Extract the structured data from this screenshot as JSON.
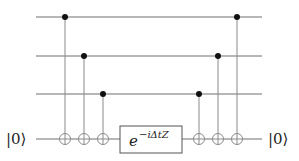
{
  "diagram": {
    "type": "quantum-circuit",
    "num_wires": 4,
    "input_label": "|0⟩",
    "output_label": "|0⟩",
    "ancilla_wire": 3,
    "gates_left": [
      {
        "type": "CNOT",
        "control": 0,
        "target": 3
      },
      {
        "type": "CNOT",
        "control": 1,
        "target": 3
      },
      {
        "type": "CNOT",
        "control": 2,
        "target": 3
      }
    ],
    "center_gate": {
      "wire": 3,
      "base": "e",
      "exponent": "−iΔtZ"
    },
    "gates_right": [
      {
        "type": "CNOT",
        "control": 2,
        "target": 3
      },
      {
        "type": "CNOT",
        "control": 1,
        "target": 3
      },
      {
        "type": "CNOT",
        "control": 0,
        "target": 3
      }
    ]
  }
}
